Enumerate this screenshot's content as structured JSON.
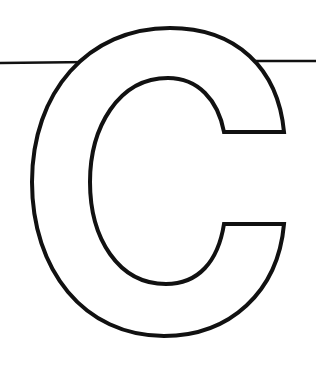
{
  "page": {
    "letter": "C",
    "style": "outline-letter-coloring-page",
    "top_text_fragment": ""
  },
  "colors": {
    "background": "#ffffff",
    "stroke": "#111111",
    "fill": "#ffffff"
  },
  "graphic": {
    "rule_line": {
      "y_left": 63,
      "y_right": 61,
      "x_start": 0,
      "x_end": 316
    },
    "letter_bounds": {
      "outer_left": 31,
      "outer_top": 28,
      "outer_bottom": 336,
      "terminal_right": 284
    },
    "stroke_width": 4
  }
}
